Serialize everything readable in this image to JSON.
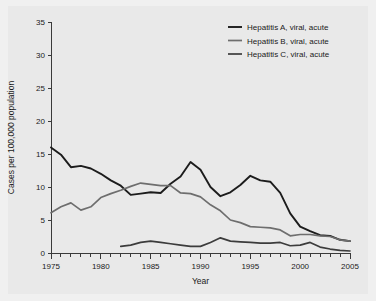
{
  "chart_data": {
    "type": "line",
    "title": "",
    "xlabel": "Year",
    "ylabel": "Cases per 100,000 population",
    "xlim": [
      1975,
      2005
    ],
    "ylim": [
      0,
      35
    ],
    "yticks": [
      0,
      5,
      10,
      15,
      20,
      25,
      30,
      35
    ],
    "ytick_labels": [
      "0",
      "5",
      "10",
      "15",
      "20",
      "25",
      "30",
      "35"
    ],
    "xticks": [
      1975,
      1980,
      1985,
      1990,
      1995,
      2000,
      2005
    ],
    "xtick_labels": [
      "1975",
      "1980",
      "1985",
      "1990",
      "1995",
      "2000",
      "2005"
    ],
    "minor_xtick_interval": 1,
    "grid": false,
    "legend_position": "top-right",
    "series": [
      {
        "name": "Hepatitis A, viral, acute",
        "color": "#1c1c1c",
        "x": [
          1975,
          1976,
          1977,
          1978,
          1979,
          1980,
          1981,
          1982,
          1983,
          1984,
          1985,
          1986,
          1987,
          1988,
          1989,
          1990,
          1991,
          1992,
          1993,
          1994,
          1995,
          1996,
          1997,
          1998,
          1999,
          2000,
          2001,
          2002,
          2003,
          2004,
          2005
        ],
        "values": [
          16.0,
          14.9,
          13.0,
          13.2,
          12.8,
          12.0,
          11.0,
          10.2,
          8.8,
          9.0,
          9.2,
          9.1,
          10.5,
          11.6,
          13.8,
          12.6,
          10.0,
          8.6,
          9.2,
          10.3,
          11.7,
          11.0,
          10.8,
          9.1,
          6.0,
          4.0,
          3.3,
          2.7,
          2.6,
          2.0,
          1.8
        ]
      },
      {
        "name": "Hepatitis B, viral, acute",
        "color": "#6e6e6e",
        "x": [
          1975,
          1976,
          1977,
          1978,
          1979,
          1980,
          1981,
          1982,
          1983,
          1984,
          1985,
          1986,
          1987,
          1988,
          1989,
          1990,
          1991,
          1992,
          1993,
          1994,
          1995,
          1996,
          1997,
          1998,
          1999,
          2000,
          2001,
          2002,
          2003,
          2004,
          2005
        ],
        "values": [
          6.1,
          7.0,
          7.6,
          6.5,
          7.0,
          8.4,
          9.0,
          9.5,
          10.1,
          10.6,
          10.4,
          10.2,
          10.2,
          9.1,
          9.0,
          8.5,
          7.3,
          6.4,
          5.0,
          4.6,
          4.0,
          3.9,
          3.8,
          3.5,
          2.6,
          2.8,
          2.8,
          2.6,
          2.5,
          2.0,
          1.8
        ]
      },
      {
        "name": "Hepatitis C, viral, acute",
        "color": "#3c3c3c",
        "x": [
          1982,
          1983,
          1984,
          1985,
          1986,
          1987,
          1988,
          1989,
          1990,
          1991,
          1992,
          1993,
          1994,
          1995,
          1996,
          1997,
          1998,
          1999,
          2000,
          2001,
          2002,
          2003,
          2004,
          2005
        ],
        "values": [
          1.0,
          1.2,
          1.6,
          1.8,
          1.6,
          1.4,
          1.2,
          1.0,
          1.0,
          1.6,
          2.3,
          1.8,
          1.7,
          1.6,
          1.5,
          1.5,
          1.6,
          1.1,
          1.2,
          1.6,
          0.9,
          0.6,
          0.4,
          0.3
        ]
      }
    ]
  },
  "legend": {
    "entries": [
      {
        "label": "Hepatitis A, viral, acute"
      },
      {
        "label": "Hepatitis B, viral, acute"
      },
      {
        "label": "Hepatitis C, viral, acute"
      }
    ]
  },
  "axes": {
    "y_title": "Cases per 100,000 population",
    "x_title": "Year"
  }
}
